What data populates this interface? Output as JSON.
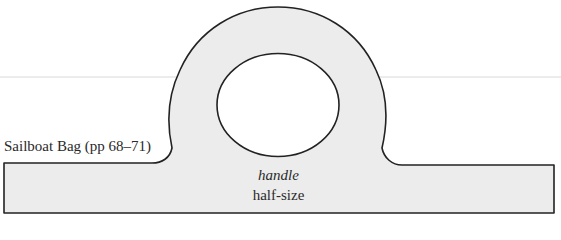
{
  "caption": "Sailboat Bag (pp 68–71)",
  "pattern_piece": {
    "name": "handle",
    "scale_note": "half-size"
  },
  "colors": {
    "fill": "#ececec",
    "stroke": "#222222",
    "hole_fill": "#ffffff",
    "guide_line": "#d8d8d8"
  }
}
